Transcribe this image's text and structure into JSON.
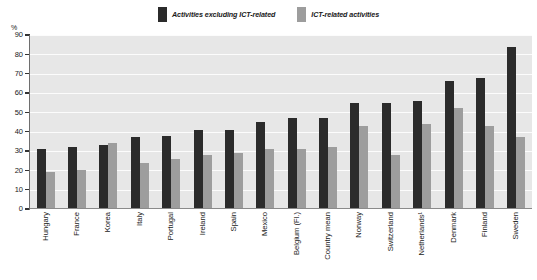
{
  "chart_data": {
    "type": "bar",
    "title": "",
    "subtitle": "",
    "xlabel": "",
    "ylabel": "%",
    "ylim": [
      0,
      90
    ],
    "yticks": [
      90,
      80,
      70,
      60,
      50,
      40,
      30,
      20,
      10,
      0
    ],
    "ytick_labels": [
      "90",
      "80",
      "70",
      "60",
      "50",
      "40",
      "30",
      "20",
      "10",
      "0"
    ],
    "grid": true,
    "legend_position": "top-center",
    "categories": [
      "Hungary",
      "France",
      "Korea",
      "Italy",
      "Portugal",
      "Ireland",
      "Spain",
      "Mexico",
      "Belgium (Fl.)",
      "Country mean",
      "Norway",
      "Switzerland",
      "Netherlands¹",
      "Denmark",
      "Finland",
      "Sweden"
    ],
    "series": [
      {
        "name": "Activities excluding ICT-related",
        "color": "#2b2b2b",
        "values": [
          31,
          32,
          33,
          37,
          38,
          41,
          41,
          45,
          47,
          47,
          55,
          55,
          56,
          66,
          68,
          84
        ]
      },
      {
        "name": "ICT-related activities",
        "color": "#9d9d9d",
        "values": [
          19,
          20,
          34,
          24,
          26,
          28,
          29,
          31,
          31,
          32,
          43,
          28,
          44,
          52,
          43,
          37
        ]
      }
    ]
  },
  "legend": {
    "entries": [
      {
        "label": "Activities excluding ICT-related",
        "swatch": "dark"
      },
      {
        "label": "ICT-related activities",
        "swatch": "light"
      }
    ]
  },
  "axis": {
    "unit_label": "%"
  },
  "colors": {
    "series_dark": "#2b2b2b",
    "series_light": "#9d9d9d",
    "plot_background": "#e7e7e7",
    "gridline": "#fcfcfc",
    "axis_line": "#6e6e6e",
    "text": "#1a1a1a"
  }
}
